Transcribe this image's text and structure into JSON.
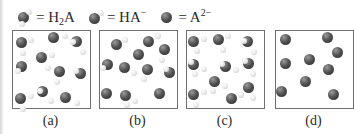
{
  "legend": {
    "items": [
      {
        "species": "H2A",
        "glyph": "two-hydrogen-molecule-icon",
        "text_main": "= H",
        "text_sub": "2",
        "text_tail": "A",
        "text_sup": ""
      },
      {
        "species": "HA-",
        "glyph": "one-hydrogen-molecule-icon",
        "text_main": "= HA",
        "text_sub": "",
        "text_tail": "",
        "text_sup": "−"
      },
      {
        "species": "A2-",
        "glyph": "bare-anion-icon",
        "text_main": "= A",
        "text_sub": "",
        "text_tail": "",
        "text_sup": "2−"
      }
    ]
  },
  "colors": {
    "anion_atom": "#3a3a3a",
    "hydrogen_atom": "#e8e8e8",
    "panel_border": "#6f6f6f"
  },
  "panels": [
    {
      "label": "(a)",
      "left": 12,
      "molecules": [
        {
          "x": 22,
          "y": 43,
          "h": [
            [
              1,
              10
            ],
            [
              9,
              -3
            ]
          ]
        },
        {
          "x": 54,
          "y": 38,
          "h": [
            [
              11,
              -2
            ]
          ]
        },
        {
          "x": 77,
          "y": 42,
          "h": [
            [
              -4,
              0
            ],
            [
              6,
              10
            ]
          ]
        },
        {
          "x": 22,
          "y": 67,
          "h": [
            [
              -4,
              4
            ]
          ]
        },
        {
          "x": 42,
          "y": 58,
          "h": [
            [
              10,
              -3
            ],
            [
              6,
              10
            ]
          ]
        },
        {
          "x": 60,
          "y": 72,
          "h": [
            [
              -3,
              10
            ]
          ]
        },
        {
          "x": 81,
          "y": 74,
          "h": [
            [
              -5,
              -3
            ]
          ]
        },
        {
          "x": 21,
          "y": 99,
          "h": [
            [
              10,
              -3
            ],
            [
              2,
              10
            ]
          ]
        },
        {
          "x": 43,
          "y": 92,
          "h": [
            [
              -3,
              -1
            ],
            [
              8,
              9
            ]
          ]
        },
        {
          "x": 66,
          "y": 98,
          "h": [
            [
              11,
              5
            ]
          ]
        }
      ]
    },
    {
      "label": "(b)",
      "left": 99,
      "molecules": [
        {
          "x": 117,
          "y": 45,
          "h": [
            [
              8,
              -5
            ]
          ]
        },
        {
          "x": 149,
          "y": 42,
          "h": [
            [
              9,
              -6
            ]
          ]
        },
        {
          "x": 139,
          "y": 55,
          "h": []
        },
        {
          "x": 165,
          "y": 50,
          "h": [
            [
              -3,
              10
            ]
          ]
        },
        {
          "x": 108,
          "y": 65,
          "h": [
            [
              -5,
              3
            ]
          ]
        },
        {
          "x": 125,
          "y": 68,
          "h": [
            [
              9,
              5
            ]
          ]
        },
        {
          "x": 148,
          "y": 70,
          "h": [
            [
              -4,
              9
            ]
          ]
        },
        {
          "x": 170,
          "y": 73,
          "h": [
            [
              -4,
              -4
            ]
          ]
        },
        {
          "x": 107,
          "y": 94,
          "h": []
        },
        {
          "x": 126,
          "y": 96,
          "h": [
            [
              9,
              5
            ],
            [
              1,
              9
            ]
          ]
        },
        {
          "x": 160,
          "y": 94,
          "h": []
        }
      ]
    },
    {
      "label": "(c)",
      "left": 186,
      "molecules": [
        {
          "x": 194,
          "y": 42,
          "h": [
            [
              10,
              -3
            ],
            [
              3,
              9
            ]
          ]
        },
        {
          "x": 219,
          "y": 40,
          "h": [
            [
              9,
              -4
            ],
            [
              4,
              10
            ]
          ]
        },
        {
          "x": 248,
          "y": 42,
          "h": [
            [
              -4,
              -1
            ],
            [
              6,
              10
            ]
          ]
        },
        {
          "x": 194,
          "y": 65,
          "h": [
            [
              -3,
              -3
            ],
            [
              10,
              4
            ],
            [
              1,
              9
            ]
          ]
        },
        {
          "x": 226,
          "y": 67,
          "h": [
            [
              -4,
              -3
            ],
            [
              10,
              3
            ]
          ]
        },
        {
          "x": 249,
          "y": 64,
          "h": [
            [
              -4,
              -3
            ],
            [
              4,
              10
            ]
          ]
        },
        {
          "x": 215,
          "y": 82,
          "h": [
            [
              10,
              4
            ],
            [
              -2,
              9
            ]
          ]
        },
        {
          "x": 194,
          "y": 95,
          "h": [
            [
              10,
              -3
            ],
            [
              2,
              10
            ]
          ]
        },
        {
          "x": 232,
          "y": 99,
          "h": [
            [
              9,
              -4
            ]
          ]
        },
        {
          "x": 249,
          "y": 88,
          "h": [
            [
              4,
              10
            ]
          ]
        }
      ]
    },
    {
      "label": "(d)",
      "left": 275,
      "molecules": [
        {
          "x": 286,
          "y": 40,
          "h": []
        },
        {
          "x": 328,
          "y": 38,
          "h": []
        },
        {
          "x": 310,
          "y": 60,
          "h": []
        },
        {
          "x": 338,
          "y": 53,
          "h": []
        },
        {
          "x": 286,
          "y": 64,
          "h": []
        },
        {
          "x": 329,
          "y": 70,
          "h": []
        },
        {
          "x": 306,
          "y": 82,
          "h": []
        },
        {
          "x": 282,
          "y": 92,
          "h": []
        },
        {
          "x": 334,
          "y": 95,
          "h": []
        }
      ]
    }
  ]
}
